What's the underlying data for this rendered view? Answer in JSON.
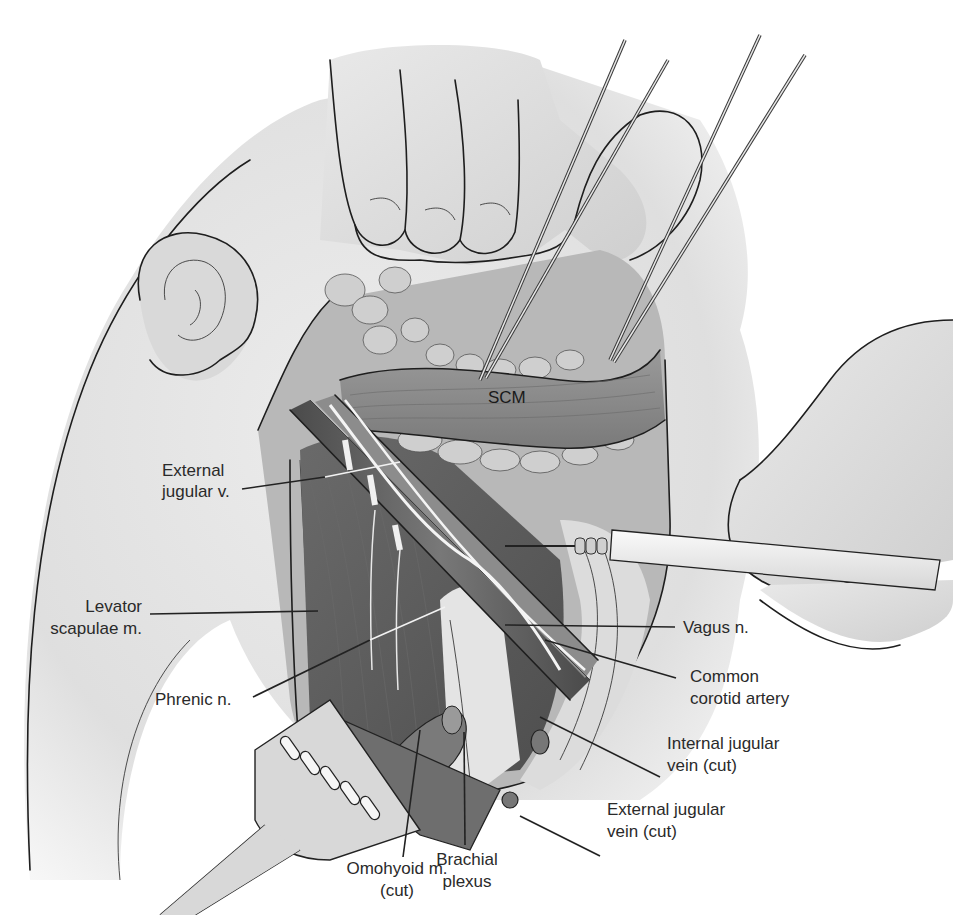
{
  "figure": {
    "style": "grayscale medical illustration",
    "colors": {
      "background": "#ffffff",
      "skin": "#dedede",
      "muscle_dark": "#5f5f5f",
      "muscle_mid": "#8a8a8a",
      "fat": "#c8c8c8",
      "nerve": "#f0f0f0",
      "ink": "#1e1e1e",
      "label_text": "#2a2a2a"
    }
  },
  "labels": {
    "scm": "SCM",
    "external_jugular_v": [
      "External",
      "jugular v."
    ],
    "levator_scapulae": [
      "Levator",
      "scapulae m."
    ],
    "phrenic_n": "Phrenic n.",
    "vagus_n": "Vagus n.",
    "common_carotid": [
      "Common",
      "corotid artery"
    ],
    "internal_jugular": [
      "Internal jugular",
      "vein (cut)"
    ],
    "external_jugular_cut": [
      "External jugular",
      "vein (cut)"
    ],
    "brachial_plexus": [
      "Brachial",
      "plexus"
    ],
    "omohyoid": [
      "Omohyoid m.",
      "(cut)"
    ]
  },
  "icons": {
    "forceps_left": "forceps-icon",
    "forceps_right": "forceps-icon",
    "retractor": "retractor-icon",
    "electrocautery": "cautery-pencil-icon",
    "hand_top": "hand-icon",
    "hand_right": "hand-icon",
    "ear": "ear-icon"
  }
}
